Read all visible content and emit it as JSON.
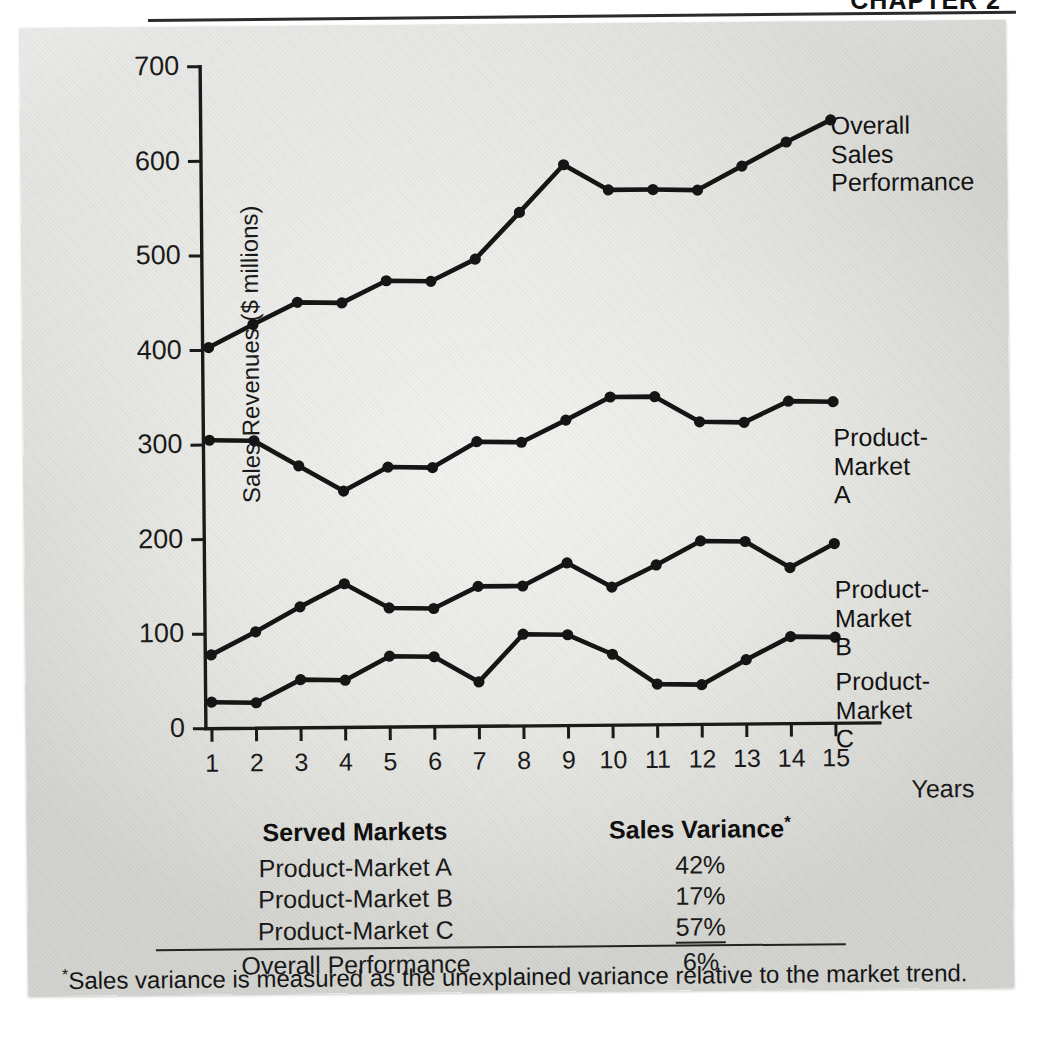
{
  "header": {
    "title": "CHAPTER 2",
    "note": "partially cropped chapter heading at top edge"
  },
  "figure": {
    "y_axis_title": "Sales Revenues ($ millions)",
    "x_axis_title": "Years"
  },
  "series_labels": {
    "overall": "Overall Sales\nPerformance",
    "a": "Product-\nMarket A",
    "b": "Product-\nMarket B",
    "c": "Product-\nMarket C"
  },
  "table": {
    "header_markets": "Served Markets",
    "header_variance": "Sales Variance",
    "header_variance_star": "*",
    "rows": [
      {
        "market": "Product-Market A",
        "variance": "42%"
      },
      {
        "market": "Product-Market B",
        "variance": "17%"
      },
      {
        "market": "Product-Market C",
        "variance": "57%"
      },
      {
        "market": "Overall Performance",
        "variance": "6%"
      }
    ]
  },
  "footnote": {
    "star": "*",
    "text": "Sales variance is measured as the unexplained variance relative to the market trend."
  },
  "colors": {
    "ink": "#151515",
    "panel_light": "#f2f2f0",
    "panel_dark": "#d2d2ce",
    "axis": "#1a1a1a"
  },
  "chart_data": {
    "type": "line",
    "title": "",
    "xlabel": "Years",
    "ylabel": "Sales Revenues ($ millions)",
    "x": [
      1,
      2,
      3,
      4,
      5,
      6,
      7,
      8,
      9,
      10,
      11,
      12,
      13,
      14,
      15
    ],
    "xtick_labels": [
      "1",
      "2",
      "3",
      "4",
      "5",
      "6",
      "7",
      "8",
      "9",
      "10",
      "11",
      "12",
      "13",
      "14",
      "15"
    ],
    "ytick_labels": [
      "0",
      "100",
      "200",
      "300",
      "400",
      "500",
      "600",
      "700"
    ],
    "yticks": [
      0,
      100,
      200,
      300,
      400,
      500,
      600,
      700
    ],
    "ylim": [
      0,
      700
    ],
    "xlim": [
      0.5,
      15.5
    ],
    "grid": false,
    "legend": "inline-right-labels",
    "marker": "filled-circle",
    "series": [
      {
        "name": "Overall Sales Performance",
        "values": [
          403,
          427,
          450,
          449,
          472,
          471,
          494,
          543,
          593,
          566,
          566,
          565,
          590,
          615,
          638
        ]
      },
      {
        "name": "Product-Market A",
        "values": [
          305,
          304,
          277,
          250,
          275,
          274,
          301,
          300,
          323,
          347,
          347,
          320,
          319,
          341,
          340
        ]
      },
      {
        "name": "Product-Market B",
        "values": [
          78,
          102,
          128,
          152,
          126,
          125,
          148,
          148,
          172,
          146,
          169,
          194,
          193,
          165,
          190
        ]
      },
      {
        "name": "Product-Market C",
        "values": [
          28,
          27,
          51,
          50,
          75,
          74,
          47,
          97,
          96,
          75,
          43,
          42,
          68,
          92,
          91
        ]
      }
    ],
    "annotations": [
      {
        "text": "Product-Market A sales variance",
        "value": "42%"
      },
      {
        "text": "Product-Market B sales variance",
        "value": "17%"
      },
      {
        "text": "Product-Market C sales variance",
        "value": "57%"
      },
      {
        "text": "Overall Performance sales variance",
        "value": "6%"
      }
    ]
  }
}
